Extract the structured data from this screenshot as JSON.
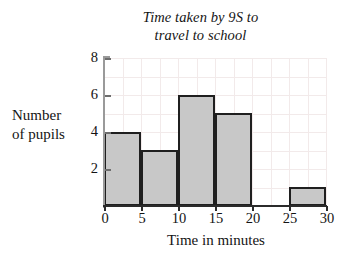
{
  "chart_data": {
    "type": "bar",
    "title": "Time taken by 9S to travel to school",
    "title_lines": [
      "Time taken by 9S to",
      "travel to school"
    ],
    "xlabel": "Time in minutes",
    "ylabel": "Number of pupils",
    "ylabel_lines": [
      "Number",
      "of pupils"
    ],
    "categories": [
      "0-5",
      "5-10",
      "10-15",
      "15-20",
      "20-25",
      "25-30"
    ],
    "bin_edges": [
      0,
      5,
      10,
      15,
      20,
      25,
      30
    ],
    "values": [
      4,
      3,
      6,
      5,
      0,
      1
    ],
    "xlim": [
      0,
      30
    ],
    "ylim": [
      0,
      8
    ],
    "xticks": [
      0,
      5,
      10,
      15,
      20,
      25,
      30
    ],
    "xtick_labels": [
      "0",
      "5",
      "10",
      "15",
      "20",
      "25",
      "30"
    ],
    "yticks": [
      2,
      4,
      6,
      8
    ],
    "ytick_labels": [
      "2",
      "4",
      "6",
      "8"
    ],
    "grid": true,
    "grid_x_step": 2.5,
    "grid_y_step": 1,
    "legend": null,
    "bar_fill_color": "#c8c8c8",
    "bar_edge_color": "#1f1f1f",
    "grid_color": "#f2eaea",
    "axis_color": "#2b2b2b"
  }
}
